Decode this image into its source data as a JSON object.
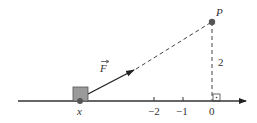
{
  "diagram": {
    "point_label": "P",
    "force_label": "F",
    "block_label": "x",
    "height_label": "2",
    "ticks": [
      {
        "label": "−2",
        "x": 154
      },
      {
        "label": "−1",
        "x": 183
      },
      {
        "label": "0",
        "x": 212
      }
    ],
    "colors": {
      "line": "#333333",
      "block_fill": "#9a9a9a",
      "point": "#555555"
    }
  }
}
